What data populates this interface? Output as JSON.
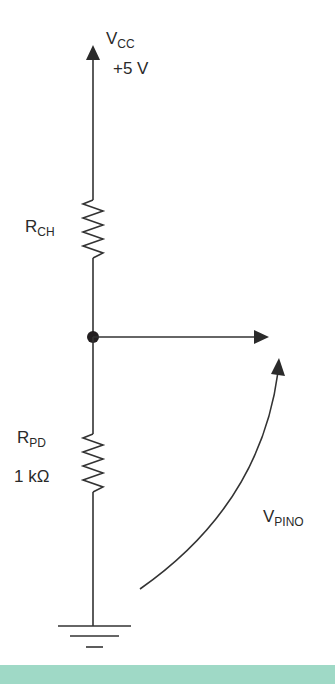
{
  "diagram": {
    "type": "voltage-divider-pull-down",
    "supply": {
      "symbol_main": "V",
      "symbol_sub": "CC",
      "value": "+5 V"
    },
    "resistors": [
      {
        "id": "rch",
        "symbol_main": "R",
        "symbol_sub": "CH",
        "value": ""
      },
      {
        "id": "rpd",
        "symbol_main": "R",
        "symbol_sub": "PD",
        "value": "1 kΩ"
      }
    ],
    "output_voltage": {
      "symbol_main": "V",
      "symbol_sub": "PINO"
    },
    "colors": {
      "line": "#333333",
      "band": "#9fd9c6",
      "background": "#ffffff"
    }
  }
}
